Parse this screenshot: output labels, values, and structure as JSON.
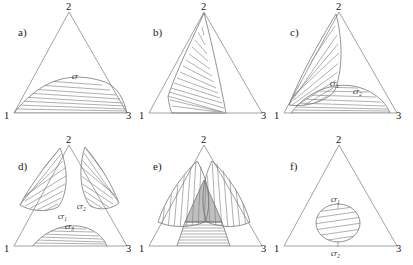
{
  "figure": {
    "vertex_labels": [
      "1",
      "2",
      "3"
    ],
    "stroke_color": "#7a7a7a",
    "gray_fill_color": "#b4b4b4",
    "background_color": "#ffffff",
    "panels": [
      {
        "id": "a",
        "letter": "a)",
        "letter_x": 18,
        "letter_y": 36,
        "origin_x": 5,
        "origin_y": 5,
        "vertices": {
          "v1": "1",
          "v2": "2",
          "v3": "3"
        },
        "labels": [
          {
            "text": "cr",
            "sub": "",
            "x": 72,
            "y": 79
          }
        ],
        "description": "single binodal lens on base 1-3 with horizontal tie-lines"
      },
      {
        "id": "b",
        "letter": "b)",
        "letter_x": 153,
        "letter_y": 36,
        "origin_x": 140,
        "origin_y": 5,
        "vertices": {
          "v1": "1",
          "v2": "2",
          "v3": "3"
        },
        "labels": [],
        "description": "wedge region from left edge fanning to base and right with tie-lines"
      },
      {
        "id": "c",
        "letter": "c)",
        "letter_x": 290,
        "letter_y": 36,
        "origin_x": 275,
        "origin_y": 5,
        "vertices": {
          "v1": "1",
          "v2": "2",
          "v3": "3"
        },
        "labels": [
          {
            "text": "cr",
            "sub": "1",
            "x": 334,
            "y": 86
          },
          {
            "text": "cr",
            "sub": "2",
            "x": 357,
            "y": 94
          }
        ],
        "description": "two regions: a steep wedge toward vertex 2 and a lens on base 1-3"
      },
      {
        "id": "d",
        "letter": "d)",
        "letter_x": 18,
        "letter_y": 168,
        "origin_x": 5,
        "origin_y": 137,
        "vertices": {
          "v1": "1",
          "v2": "2",
          "v3": "3"
        },
        "labels": [
          {
            "text": "cr",
            "sub": "1",
            "x": 62,
            "y": 218
          },
          {
            "text": "cr",
            "sub": "2",
            "x": 80,
            "y": 208
          },
          {
            "text": "cr",
            "sub": "3",
            "x": 70,
            "y": 231
          }
        ],
        "description": "three separate hatched regions on each side of triangle"
      },
      {
        "id": "e",
        "letter": "e)",
        "letter_x": 153,
        "letter_y": 168,
        "origin_x": 140,
        "origin_y": 137,
        "vertices": {
          "v1": "1",
          "v2": "2",
          "v3": "3"
        },
        "labels": [],
        "description": "two overlapping vertically-hatched wedges with gray three-phase region and horizontally hatched base region"
      },
      {
        "id": "f",
        "letter": "f)",
        "letter_x": 290,
        "letter_y": 168,
        "origin_x": 275,
        "origin_y": 137,
        "vertices": {
          "v1": "1",
          "v2": "2",
          "v3": "3"
        },
        "labels": [
          {
            "text": "cr",
            "sub": "1",
            "x": 345,
            "y": 203
          },
          {
            "text": "cr",
            "sub": "2",
            "x": 345,
            "y": 250
          }
        ],
        "description": "isolated island region in interior of triangle with tie-lines"
      }
    ]
  }
}
